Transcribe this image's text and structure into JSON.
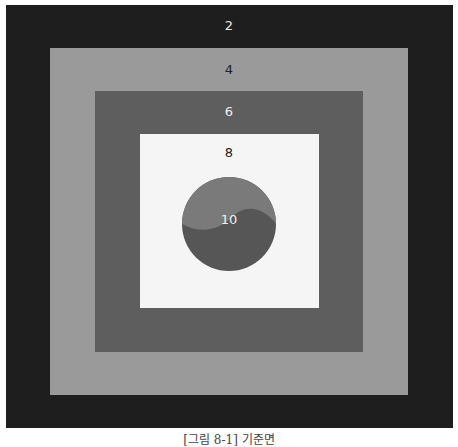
{
  "figure": {
    "levels": [
      {
        "label": "2",
        "color": "#1e1e1e",
        "text_color": "#e8e8e8"
      },
      {
        "label": "4",
        "color": "#9a9a9a",
        "text_color": "#222222"
      },
      {
        "label": "6",
        "color": "#5e5e5e",
        "text_color": "#f0f0f0"
      },
      {
        "label": "8",
        "color": "#f5f5f5",
        "text_color": "#222222"
      },
      {
        "label": "10",
        "color": "#6a6a6a",
        "text_color": "#f0f0f0"
      }
    ],
    "circle": {
      "upper_color": "#7a7a7a",
      "lower_color": "#565656"
    },
    "caption": "[그림 8-1] 기준면"
  }
}
